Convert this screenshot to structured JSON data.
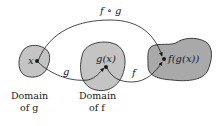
{
  "diagram": {
    "type": "function-composition",
    "colors": {
      "domain_g_fill": "#c4c4c4",
      "domain_f_fill": "#c4c4c4",
      "range_fill": "#a9a9a9",
      "stroke": "#1a1a1a",
      "background": "#ffffff"
    },
    "arrows": {
      "composition": "f ∘ g",
      "g": "g",
      "f": "f"
    },
    "points": {
      "x": "x",
      "gx": "g(x)",
      "fgx": "f(g(x))"
    },
    "captions": {
      "domain_g": {
        "line1": "Domain",
        "line2": "of g"
      },
      "domain_f": {
        "line1": "Domain",
        "line2": "of f"
      }
    }
  }
}
